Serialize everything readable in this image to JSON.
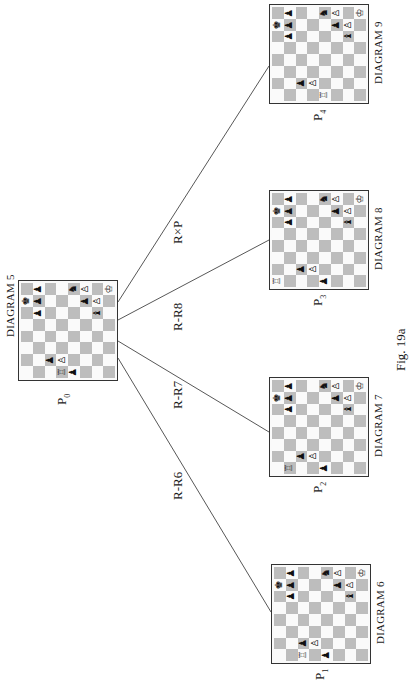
{
  "figure": {
    "caption": "Fig. 19a"
  },
  "colors": {
    "dark_square": "#bdbdbd",
    "light_square": "#fafafa",
    "border": "#333333",
    "edge": "#444444"
  },
  "root": {
    "id": "P0",
    "node_label": "P",
    "node_sub": "0",
    "diagram_label": "DIAGRAM 5"
  },
  "children": [
    {
      "id": "P1",
      "node_label": "P",
      "node_sub": "1",
      "diagram_label": "DIAGRAM 6",
      "move": "R-R6"
    },
    {
      "id": "P2",
      "node_label": "P",
      "node_sub": "2",
      "diagram_label": "DIAGRAM 7",
      "move": "R-R7"
    },
    {
      "id": "P3",
      "node_label": "P",
      "node_sub": "3",
      "diagram_label": "DIAGRAM 8",
      "move": "R-R8"
    },
    {
      "id": "P4",
      "node_label": "P",
      "node_sub": "4",
      "diagram_label": "DIAGRAM 9",
      "move": "R×P"
    }
  ],
  "piece_glyphs": {
    "white_king": "♔",
    "white_rook": "♖",
    "white_pawn": "♙",
    "black_king": "♚",
    "black_knight": "♞",
    "black_bishop": "♝",
    "black_pawn": "♟"
  },
  "common_pieces": [
    {
      "r": 0,
      "c": 1,
      "p": "black_pawn"
    },
    {
      "r": 0,
      "c": 4,
      "p": "black_knight"
    },
    {
      "r": 0,
      "c": 5,
      "p": "white_pawn"
    },
    {
      "r": 0,
      "c": 7,
      "p": "white_king"
    },
    {
      "r": 1,
      "c": 0,
      "p": "white_king_alt"
    },
    {
      "r": 1,
      "c": 1,
      "p": "black_pawn"
    },
    {
      "r": 1,
      "c": 5,
      "p": "black_pawn"
    },
    {
      "r": 1,
      "c": 6,
      "p": "white_pawn"
    },
    {
      "r": 2,
      "c": 1,
      "p": "black_pawn"
    },
    {
      "r": 2,
      "c": 6,
      "p": "black_bishop"
    },
    {
      "r": 6,
      "c": 2,
      "p": "black_pawn"
    },
    {
      "r": 6,
      "c": 3,
      "p": "white_pawn"
    }
  ],
  "boards": {
    "P0": {
      "rook_col": 3,
      "pawn_r7c4": true
    },
    "P1": {
      "rook_col": 2,
      "pawn_r7c4": true
    },
    "P2": {
      "rook_col": 1,
      "pawn_r7c4": true
    },
    "P3": {
      "rook_col": 0,
      "pawn_r7c4": true
    },
    "P4": {
      "rook_col": 4,
      "pawn_r7c4": false
    }
  }
}
